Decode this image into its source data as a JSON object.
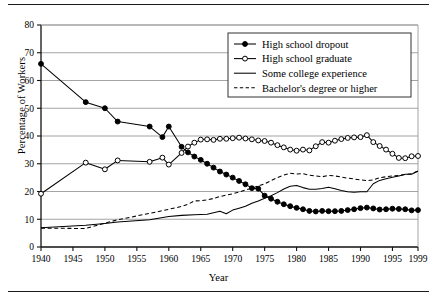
{
  "figure": {
    "xlabel": "Year",
    "ylabel": "Percentage of Workers"
  },
  "chart_data": {
    "type": "line",
    "title": "",
    "xlabel": "Year",
    "ylabel": "Percentage of Workers",
    "xlim": [
      1940,
      1999
    ],
    "ylim": [
      0,
      80
    ],
    "ytick_labels": [
      "0",
      "10",
      "20",
      "30",
      "40",
      "50",
      "60",
      "70",
      "80"
    ],
    "yticks": [
      0,
      10,
      20,
      30,
      40,
      50,
      60,
      70,
      80
    ],
    "xtick_labels": [
      "1940",
      "1945",
      "1950",
      "1955",
      "1960",
      "1965",
      "1970",
      "1975",
      "1980",
      "1985",
      "1990",
      "1995",
      "1999"
    ],
    "xticks": [
      1940,
      1945,
      1950,
      1955,
      1960,
      1965,
      1970,
      1975,
      1980,
      1985,
      1990,
      1995,
      1999
    ],
    "grid": "horizontal",
    "legend_position": "upper right",
    "series": [
      {
        "name": "High school dropout",
        "marker": "filled-circle",
        "line": "solid",
        "color": "#000000",
        "x": [
          1940,
          1947,
          1950,
          1952,
          1957,
          1959,
          1960,
          1962,
          1963,
          1964,
          1965,
          1966,
          1967,
          1968,
          1969,
          1970,
          1971,
          1972,
          1973,
          1974,
          1975,
          1976,
          1977,
          1978,
          1979,
          1980,
          1981,
          1982,
          1983,
          1984,
          1985,
          1986,
          1987,
          1988,
          1989,
          1990,
          1991,
          1992,
          1993,
          1994,
          1995,
          1996,
          1997,
          1998,
          1999
        ],
        "y": [
          66.0,
          52.2,
          50.0,
          45.2,
          43.4,
          39.6,
          43.4,
          36.1,
          34.1,
          32.6,
          31.4,
          30.0,
          28.6,
          27.2,
          26.1,
          25.0,
          23.8,
          22.6,
          21.2,
          21.0,
          18.5,
          17.4,
          16.3,
          15.4,
          14.7,
          14.1,
          13.6,
          13.0,
          12.8,
          13.0,
          12.9,
          12.9,
          13.0,
          13.3,
          13.6,
          14.0,
          14.2,
          13.9,
          13.5,
          13.6,
          13.8,
          13.7,
          13.6,
          13.2,
          13.3
        ]
      },
      {
        "name": "High school graduate",
        "marker": "open-circle",
        "line": "solid",
        "color": "#000000",
        "x": [
          1940,
          1947,
          1950,
          1952,
          1957,
          1959,
          1960,
          1962,
          1963,
          1964,
          1965,
          1966,
          1967,
          1968,
          1969,
          1970,
          1971,
          1972,
          1973,
          1974,
          1975,
          1976,
          1977,
          1978,
          1979,
          1980,
          1981,
          1982,
          1983,
          1984,
          1985,
          1986,
          1987,
          1988,
          1989,
          1990,
          1991,
          1992,
          1993,
          1994,
          1995,
          1996,
          1997,
          1998,
          1999
        ],
        "y": [
          19.2,
          30.4,
          28.0,
          31.2,
          30.7,
          32.2,
          29.7,
          33.9,
          36.2,
          37.6,
          38.7,
          38.8,
          38.6,
          39.0,
          39.0,
          39.2,
          39.4,
          39.1,
          38.8,
          38.4,
          38.2,
          37.6,
          36.7,
          35.9,
          35.1,
          34.7,
          35.1,
          34.8,
          36.3,
          37.8,
          37.6,
          38.3,
          38.9,
          39.3,
          39.5,
          39.6,
          40.3,
          37.8,
          36.4,
          35.1,
          33.6,
          32.1,
          32.0,
          32.7,
          32.8
        ]
      },
      {
        "name": "Some college experience",
        "marker": "none",
        "line": "solid",
        "color": "#000000",
        "x": [
          1940,
          1947,
          1950,
          1952,
          1957,
          1960,
          1962,
          1964,
          1966,
          1968,
          1969,
          1970,
          1971,
          1972,
          1973,
          1974,
          1975,
          1976,
          1977,
          1978,
          1979,
          1980,
          1981,
          1982,
          1983,
          1984,
          1985,
          1986,
          1987,
          1988,
          1989,
          1990,
          1991,
          1992,
          1993,
          1994,
          1995,
          1996,
          1997,
          1998,
          1999
        ],
        "y": [
          6.9,
          7.8,
          8.5,
          9.0,
          9.8,
          11.0,
          11.4,
          11.6,
          11.8,
          12.9,
          12.0,
          13.3,
          14.0,
          14.7,
          15.8,
          16.6,
          17.6,
          18.5,
          19.6,
          20.9,
          21.9,
          22.2,
          21.4,
          20.8,
          20.8,
          21.1,
          21.5,
          21.0,
          20.4,
          19.9,
          19.7,
          19.9,
          19.9,
          22.8,
          24.0,
          24.6,
          25.1,
          25.6,
          26.2,
          26.2,
          27.4
        ]
      },
      {
        "name": "Bachelor's degree or higher",
        "marker": "none",
        "line": "dashed",
        "color": "#000000",
        "x": [
          1940,
          1945,
          1947,
          1950,
          1952,
          1955,
          1957,
          1960,
          1962,
          1963,
          1964,
          1965,
          1966,
          1967,
          1968,
          1969,
          1970,
          1971,
          1972,
          1973,
          1974,
          1975,
          1976,
          1977,
          1978,
          1979,
          1980,
          1981,
          1982,
          1983,
          1984,
          1985,
          1986,
          1987,
          1988,
          1989,
          1990,
          1991,
          1992,
          1993,
          1994,
          1995,
          1996,
          1997,
          1998,
          1999
        ],
        "y": [
          6.8,
          6.7,
          6.7,
          8.6,
          9.8,
          11.2,
          12.1,
          13.6,
          14.6,
          15.4,
          16.6,
          16.7,
          17.0,
          17.5,
          18.2,
          18.7,
          19.2,
          19.8,
          20.5,
          21.2,
          22.0,
          22.8,
          23.9,
          25.0,
          25.9,
          26.6,
          26.3,
          26.4,
          25.9,
          25.6,
          25.3,
          25.8,
          25.6,
          25.2,
          24.8,
          24.5,
          24.2,
          23.9,
          24.2,
          25.0,
          25.3,
          25.6,
          25.8,
          26.1,
          26.4,
          27.4
        ]
      }
    ]
  },
  "legend": {
    "items": [
      {
        "label": "High school dropout",
        "style": "filled-circle-line"
      },
      {
        "label": "High school graduate",
        "style": "open-circle-line"
      },
      {
        "label": "Some college experience",
        "style": "solid-line"
      },
      {
        "label": "Bachelor's degree or higher",
        "style": "dashed-line"
      }
    ]
  }
}
